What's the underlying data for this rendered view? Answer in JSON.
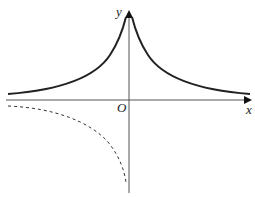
{
  "diagram": {
    "type": "function-graph",
    "axes": {
      "x_label": "x",
      "y_label": "y",
      "origin_label": "O"
    },
    "curves": [
      {
        "name": "solid-curve-upper",
        "style": "solid",
        "description": "y = a^|x| type decay, symmetric about y-axis, above x-axis"
      },
      {
        "name": "dashed-curve-lower-left",
        "style": "dashed",
        "description": "branch in third quadrant approaching x-axis leftward and going down near y-axis"
      }
    ],
    "colors": {
      "axis": "#555555",
      "curve": "#222222",
      "background": "#ffffff"
    }
  }
}
